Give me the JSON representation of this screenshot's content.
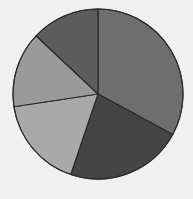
{
  "chart_data": {
    "type": "pie",
    "title": "",
    "legend": [],
    "start_angle_deg": 0,
    "direction": "clockwise",
    "center": [
      98,
      94
    ],
    "radius": 85,
    "slices": [
      {
        "label": "",
        "value": 32.9,
        "color": "#6e6e6e"
      },
      {
        "label": "",
        "value": 22.3,
        "color": "#454545"
      },
      {
        "label": "",
        "value": 17.4,
        "color": "#a9a9a9"
      },
      {
        "label": "",
        "value": 14.4,
        "color": "#9a9a9a"
      },
      {
        "label": "",
        "value": 13.0,
        "color": "#5c5c5c"
      }
    ],
    "values": [
      32.9,
      22.3,
      17.4,
      14.4,
      13.0
    ],
    "stroke_color": "#2a2a2a",
    "background": "#f0f0f0"
  }
}
